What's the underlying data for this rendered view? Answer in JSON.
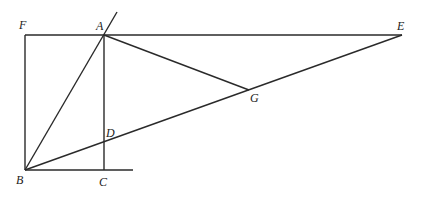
{
  "diagram": {
    "points": {
      "F": {
        "label": "F",
        "x": 25,
        "y": 35
      },
      "A": {
        "label": "A",
        "x": 104,
        "y": 35
      },
      "E": {
        "label": "E",
        "x": 402,
        "y": 35
      },
      "G": {
        "label": "G",
        "x": 249,
        "y": 90
      },
      "D": {
        "label": "D",
        "x": 104,
        "y": 140
      },
      "B": {
        "label": "B",
        "x": 25,
        "y": 170
      },
      "C": {
        "label": "C",
        "x": 104,
        "y": 170
      }
    },
    "segments": [
      "F-A-E",
      "F-B",
      "B-A (extended)",
      "A-C",
      "A-G",
      "B-G-E",
      "B-C (extended)"
    ]
  }
}
